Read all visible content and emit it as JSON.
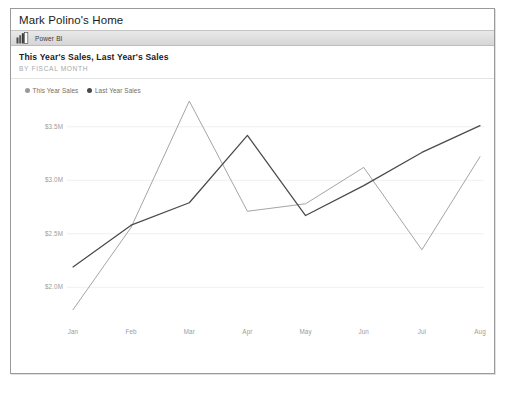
{
  "window": {
    "title": "Mark Polino's Home"
  },
  "branding": {
    "icon": "powerbi-bars-icon",
    "label": "Power BI"
  },
  "card": {
    "title": "This Year's Sales, Last Year's Sales",
    "subtitle": "BY FISCAL MONTH"
  },
  "colors": {
    "this_year": "#9a9a9a",
    "last_year": "#4a4a4a",
    "grid": "#f0f0f0",
    "axis_text": "#9c9c9c",
    "title_text": "#222222",
    "subtitle_text": "#a8a8a8",
    "frame": "#9a9a9a",
    "pbi_bar": "#dedede"
  },
  "chart_data": {
    "type": "line",
    "title": "This Year's Sales, Last Year's Sales",
    "subtitle": "BY FISCAL MONTH",
    "xlabel": "",
    "ylabel": "",
    "categories": [
      "Jan",
      "Feb",
      "Mar",
      "Apr",
      "May",
      "Jun",
      "Jul",
      "Aug"
    ],
    "ylim": [
      1.75,
      3.75
    ],
    "yticks": [
      2.0,
      2.5,
      3.0,
      3.5
    ],
    "ytick_labels": [
      "$2.0M",
      "$2.5M",
      "$3.0M",
      "$3.5M"
    ],
    "grid": true,
    "legend_position": "top-left",
    "series": [
      {
        "name": "This Year Sales",
        "color": "#9a9a9a",
        "values": [
          1.79,
          2.56,
          3.74,
          2.71,
          2.78,
          3.12,
          2.35,
          3.22
        ]
      },
      {
        "name": "Last Year Sales",
        "color": "#4a4a4a",
        "values": [
          2.19,
          2.58,
          2.79,
          3.42,
          2.67,
          2.95,
          3.26,
          3.51
        ]
      }
    ]
  },
  "legend": [
    {
      "label": "This Year Sales",
      "color": "#9a9a9a"
    },
    {
      "label": "Last Year Sales",
      "color": "#4a4a4a"
    }
  ]
}
